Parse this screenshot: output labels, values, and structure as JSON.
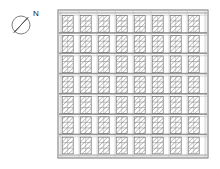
{
  "document": {
    "type": "architectural-site-plan",
    "title": "Site Plan",
    "orientation_label": "N",
    "background_color": "#ffffff",
    "line_color": "#6f6f6f",
    "hatch_color": "#8a8a8a",
    "needle_color": "#111111"
  },
  "compass": {
    "name": "north-arrow",
    "label": "N",
    "center_x": 21,
    "center_y": 25,
    "radius": 9,
    "needle_angle_deg": 40,
    "label_x": 34,
    "label_y": 13,
    "ring_color": "#707070",
    "needle_fill_dark": "#111111",
    "needle_fill_light": "#ffffff"
  },
  "plot": {
    "name": "site-boundary",
    "x": 58,
    "y": 10,
    "width": 150,
    "height": 148,
    "border_color": "#9a9a9a",
    "fill": "#ffffff"
  },
  "grid": {
    "columns": 8,
    "rows": 7,
    "column_pitch": 18.2,
    "row_pitch": 20.6,
    "inner_margin_x": 3,
    "inner_margin_y": 3,
    "street_line_color": "#7d7d7d",
    "street_line_width": 0.7,
    "secondary_line_color": "#b4b4b4"
  },
  "block": {
    "name": "building-block",
    "width": 11,
    "height": 17,
    "outline_color": "#6a6a6a",
    "hatch_color": "#7c7c7c",
    "hatch_spacing": 2.6,
    "hatch_angle_deg": 45,
    "hatch_width": 0.6
  },
  "chart_data": {
    "type": "map",
    "legend": [
      "N"
    ],
    "grid_columns": 8,
    "grid_rows": 7,
    "total_blocks": 56
  }
}
